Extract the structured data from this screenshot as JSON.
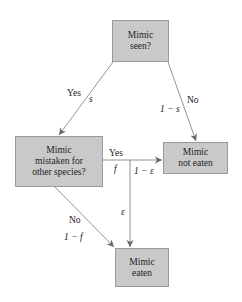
{
  "nodes": {
    "seen": {
      "line1": "Mimic",
      "line2": "seen?"
    },
    "mistaken": {
      "line1": "Mimic",
      "line2": "mistaken for",
      "line3": "other species?"
    },
    "not_eaten": {
      "line1": "Mimic",
      "line2": "not eaten"
    },
    "eaten": {
      "line1": "Mimic",
      "line2": "eaten"
    }
  },
  "edges": {
    "seen_yes": {
      "label": "Yes",
      "prob": "s"
    },
    "seen_no": {
      "label": "No",
      "prob": "1 − s"
    },
    "mistaken_yes": {
      "label": "Yes",
      "prob": "f"
    },
    "mistaken_no": {
      "label": "No",
      "prob": "1 − f"
    },
    "yes_not_eaten": {
      "prob": "1 − ε"
    },
    "yes_eaten": {
      "prob": "ε"
    }
  },
  "colors": {
    "box_fill": "#c9c9c9",
    "box_border": "#9a9a9a",
    "line": "#777777"
  }
}
